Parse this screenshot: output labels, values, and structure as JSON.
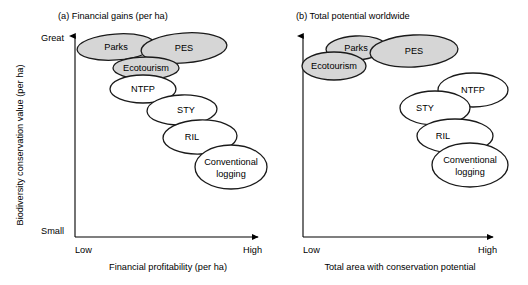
{
  "figure": {
    "background_color": "#ffffff",
    "shaded_fill": "#d6d6d6",
    "unshaded_fill": "#ffffff",
    "stroke_color": "#1a1a1a"
  },
  "panels": [
    {
      "id": "panel-a",
      "title": "(a) Financial gains (per ha)",
      "y_axis": {
        "label": "Biodiversity conservation value (per ha)",
        "top_tick": "Great",
        "bottom_tick": "Small"
      },
      "x_axis": {
        "label": "Financial profitability (per ha)",
        "left_tick": "Low",
        "right_tick": "High"
      },
      "ellipses": [
        {
          "label": "Parks",
          "shaded": true,
          "cx": 116,
          "cy": 47,
          "rx": 39,
          "ry": 13,
          "rot": -4,
          "label_dx": 0,
          "label_dy": 3
        },
        {
          "label": "PES",
          "shaded": true,
          "cx": 184,
          "cy": 48,
          "rx": 43,
          "ry": 15,
          "rot": -4,
          "label_dx": 0,
          "label_dy": 3
        },
        {
          "label": "Ecotourism",
          "shaded": true,
          "cx": 146,
          "cy": 68,
          "rx": 33,
          "ry": 11,
          "rot": 0,
          "label_dx": 0,
          "label_dy": 3
        },
        {
          "label": "NTFP",
          "shaded": false,
          "cx": 143,
          "cy": 89,
          "rx": 33,
          "ry": 14,
          "rot": 0,
          "label_dx": 0,
          "label_dy": 3
        },
        {
          "label": "STY",
          "shaded": false,
          "cx": 182,
          "cy": 110,
          "rx": 35,
          "ry": 15,
          "rot": -2,
          "label_dx": 4,
          "label_dy": 3
        },
        {
          "label": "RIL",
          "shaded": false,
          "cx": 200,
          "cy": 137,
          "rx": 37,
          "ry": 17,
          "rot": -2,
          "label_dx": -8,
          "label_dy": 3
        },
        {
          "label": "Conventional logging",
          "shaded": false,
          "cx": 231,
          "cy": 167,
          "rx": 36,
          "ry": 22,
          "rot": 0,
          "label_dx": 0,
          "label_dy": -2
        }
      ]
    },
    {
      "id": "panel-b",
      "title": "(b) Total potential worldwide",
      "y_axis": {
        "label": "",
        "top_tick": "",
        "bottom_tick": ""
      },
      "x_axis": {
        "label": "Total area with conservation potential",
        "left_tick": "Low",
        "right_tick": "High"
      },
      "ellipses": [
        {
          "label": "Parks",
          "shaded": true,
          "cx": 356,
          "cy": 48,
          "rx": 30,
          "ry": 12,
          "rot": -3,
          "label_dx": 0,
          "label_dy": 3
        },
        {
          "label": "PES",
          "shaded": true,
          "cx": 414,
          "cy": 51,
          "rx": 44,
          "ry": 16,
          "rot": -3,
          "label_dx": 0,
          "label_dy": 3
        },
        {
          "label": "Ecotourism",
          "shaded": true,
          "cx": 334,
          "cy": 66,
          "rx": 32,
          "ry": 14,
          "rot": 0,
          "label_dx": 0,
          "label_dy": 3
        },
        {
          "label": "NTFP",
          "shaded": false,
          "cx": 473,
          "cy": 90,
          "rx": 35,
          "ry": 17,
          "rot": 0,
          "label_dx": 0,
          "label_dy": 3
        },
        {
          "label": "STY",
          "shaded": false,
          "cx": 435,
          "cy": 108,
          "rx": 35,
          "ry": 17,
          "rot": 0,
          "label_dx": -10,
          "label_dy": 3
        },
        {
          "label": "RIL",
          "shaded": false,
          "cx": 455,
          "cy": 136,
          "rx": 38,
          "ry": 17,
          "rot": 0,
          "label_dx": -12,
          "label_dy": 3
        },
        {
          "label": "Conventional logging",
          "shaded": false,
          "cx": 470,
          "cy": 165,
          "rx": 38,
          "ry": 22,
          "rot": 0,
          "label_dx": 0,
          "label_dy": -2
        }
      ]
    }
  ]
}
